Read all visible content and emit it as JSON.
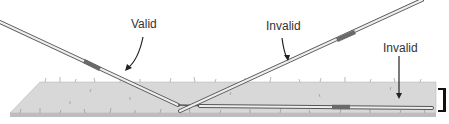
{
  "diagram": {
    "labels": [
      {
        "text": "Valid",
        "x": 131,
        "y": 17
      },
      {
        "text": "Invalid",
        "x": 266,
        "y": 19
      },
      {
        "text": "Invalid",
        "x": 383,
        "y": 41
      }
    ],
    "colors": {
      "turf": "#d6d6d6",
      "turf_edge": "#9a9a9a",
      "javelin_outline": "#555555",
      "javelin_fill": "#eeeeee",
      "grip": "#6a6a6a",
      "text": "#333333",
      "marker": "#111111"
    }
  }
}
